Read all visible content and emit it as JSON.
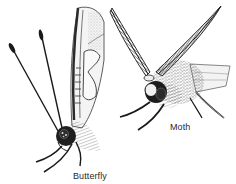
{
  "figure": {
    "background": "#ffffff",
    "ink": "#1a1a1a",
    "subjects": [
      {
        "name": "butterfly",
        "label": "Butterfly"
      },
      {
        "name": "moth",
        "label": "Moth"
      }
    ]
  },
  "labels": {
    "butterfly": "Butterfly",
    "moth": "Moth"
  }
}
